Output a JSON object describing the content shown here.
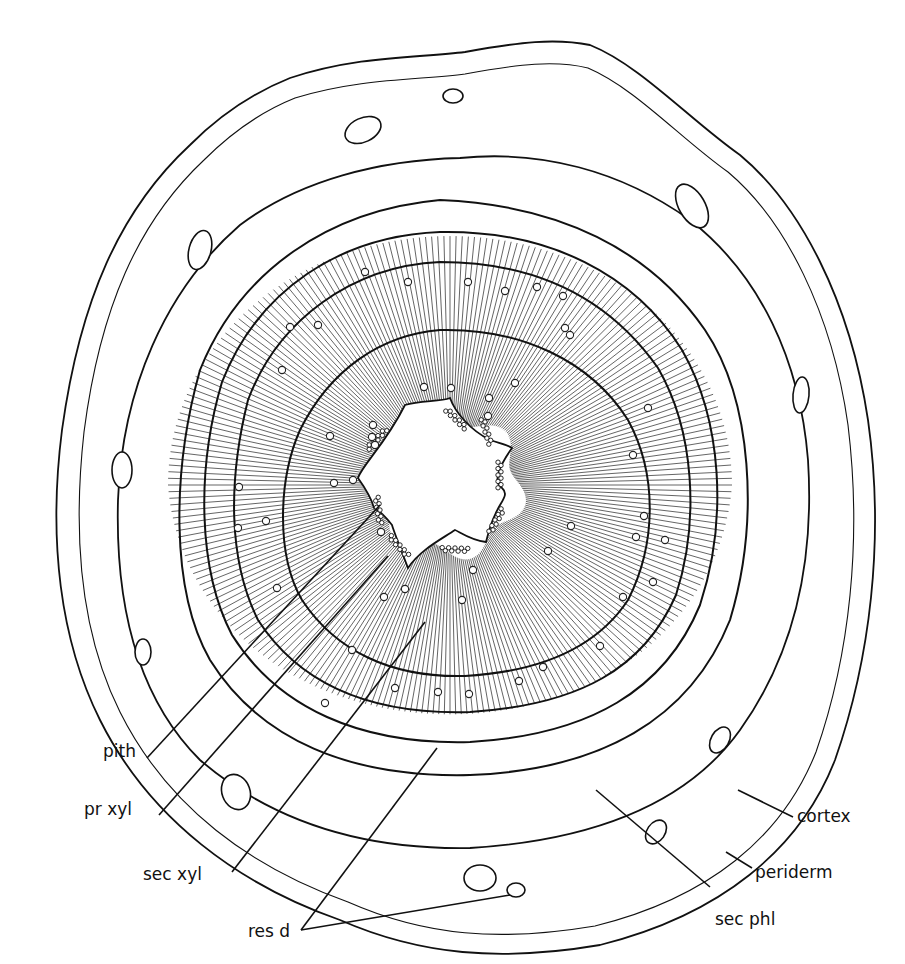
{
  "figure": {
    "labels": [
      {
        "id": "pith",
        "text": "pith",
        "x": 103,
        "y": 750,
        "tx": 380,
        "ty": 505
      },
      {
        "id": "pr-xyl",
        "text": "pr xyl",
        "x": 84,
        "y": 810,
        "tx": 388,
        "ty": 555
      },
      {
        "id": "sec-xyl",
        "text": "sec xyl",
        "x": 143,
        "y": 875,
        "tx": 425,
        "ty": 625
      },
      {
        "id": "res-d",
        "text": "res d",
        "x": 248,
        "y": 932,
        "tx": 438,
        "ty": 748
      },
      {
        "id": "cortex",
        "text": "cortex",
        "x": 795,
        "y": 817,
        "tx": 738,
        "ty": 790
      },
      {
        "id": "periderm",
        "text": "periderm",
        "x": 753,
        "y": 874,
        "tx": 726,
        "ty": 853
      },
      {
        "id": "sec-phl",
        "text": "sec phl",
        "x": 730,
        "y": 921,
        "tx": 596,
        "ty": 790
      }
    ],
    "colors": {
      "ink": "#111111",
      "background": "#ffffff"
    }
  }
}
